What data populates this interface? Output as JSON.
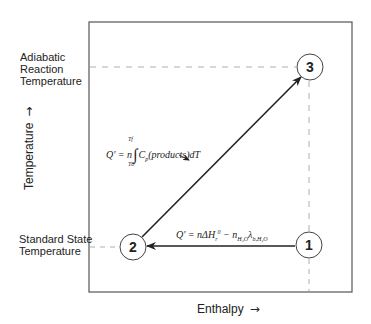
{
  "diagram": {
    "title": "",
    "axes": {
      "x_label": "Enthalpy",
      "x_arrow": "→",
      "y_label": "Temperature",
      "y_arrow": "→"
    },
    "temperature_levels": {
      "adiabatic": "Adiabatic Reaction Temperature",
      "adiabatic_lines": [
        "Adiabatic",
        "Reaction",
        "Temperature"
      ],
      "standard": "Standard State Temperature",
      "standard_lines": [
        "Standard State",
        "Temperature"
      ]
    },
    "states": [
      {
        "id": "1",
        "label": "1"
      },
      {
        "id": "2",
        "label": "2"
      },
      {
        "id": "3",
        "label": "3"
      }
    ],
    "paths": [
      {
        "from": "1",
        "to": "2",
        "equation": "Q' = nΔH_r^0 − n_{H2O} λ_{b,H2O}",
        "parts": {
          "lhs": "Q' = nΔH",
          "sub_r": "r",
          "sup_0": "0",
          "minus": " − n",
          "sub_h2o": "H₂O",
          "lambda": "λ",
          "sub_b_h2o": "b,H₂O"
        }
      },
      {
        "from": "2",
        "to": "3",
        "equation": "Q' = n ∫_{T0}^{Tf} C_p(products) dT",
        "parts": {
          "lhs": "Q' = n",
          "integral": "∫",
          "upper": "Tf",
          "lower": "T0",
          "cp": "C",
          "cp_sub": "p",
          "body": "(products)dT"
        }
      }
    ]
  },
  "colors": {
    "line": "#2a2a2a",
    "dashed": "#9a9a9a",
    "frame": "#555555",
    "background": "#ffffff"
  }
}
